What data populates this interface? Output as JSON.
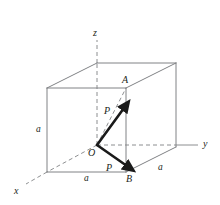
{
  "figure": {
    "type": "3d-cube-force-diagram",
    "colors": {
      "cube_edge": "#808285",
      "hidden_edge": "#808285",
      "axis": "#808285",
      "vector": "#1a1a1a",
      "label": "#231f20",
      "background": "#ffffff"
    },
    "axes": [
      {
        "name": "z-axis",
        "label": "z",
        "direction": "up"
      },
      {
        "name": "y-axis",
        "label": "y",
        "direction": "right"
      },
      {
        "name": "x-axis",
        "label": "x",
        "direction": "down-left"
      }
    ],
    "points": [
      {
        "name": "origin",
        "label": "O"
      },
      {
        "name": "point-a",
        "label": "A"
      },
      {
        "name": "point-b",
        "label": "B"
      }
    ],
    "dimensions": [
      {
        "name": "edge-left-vertical",
        "label": "a"
      },
      {
        "name": "edge-bottom-front",
        "label": "a"
      },
      {
        "name": "edge-bottom-right",
        "label": "a"
      }
    ],
    "vectors": [
      {
        "name": "force-p-upper",
        "label": "P",
        "from": "O",
        "toward": "A"
      },
      {
        "name": "force-p-lower",
        "label": "P",
        "from": "O",
        "toward": "B"
      }
    ]
  }
}
